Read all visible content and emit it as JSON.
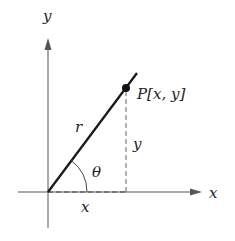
{
  "diagram": {
    "type": "polar-cartesian-relationship",
    "labels": {
      "y_axis": "y",
      "x_axis": "x",
      "point": "P[x, y]",
      "radius": "r",
      "angle": "θ",
      "vertical_leg": "y",
      "horizontal_leg": "x"
    },
    "colors": {
      "axis": "#555555",
      "radius_line": "#1a1a1a",
      "dashed": "#666666",
      "point": "#111111",
      "text": "#222222"
    }
  }
}
